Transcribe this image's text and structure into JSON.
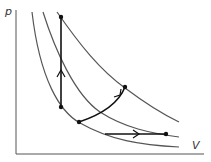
{
  "diagram": {
    "type": "pV-diagram",
    "axes": {
      "y_label": "p",
      "x_label": "V"
    },
    "colors": {
      "axis": "#555555",
      "isotherm": "#555555",
      "process": "#111111",
      "point": "#111111"
    },
    "isotherms": [
      {
        "name": "isotherm-low",
        "path": "M32,12 C40,80 60,112 80,123 C110,140 140,145 179,147"
      },
      {
        "name": "isotherm-mid",
        "path": "M43,12 C55,50 75,95 100,112 C125,128 150,133 179,137"
      },
      {
        "name": "isotherm-high",
        "path": "M57,12 C80,45 100,70 125,88 C145,103 160,113 179,122"
      }
    ],
    "points": [
      {
        "name": "point-top",
        "x": 61,
        "y": 17
      },
      {
        "name": "point-left",
        "x": 61,
        "y": 107
      },
      {
        "name": "point-bottom",
        "x": 79,
        "y": 122
      },
      {
        "name": "point-upper-right",
        "x": 125,
        "y": 87
      },
      {
        "name": "point-lower-right",
        "x": 166,
        "y": 134
      }
    ],
    "processes": [
      {
        "name": "isochoric-process",
        "path": "M61,107 L61,17",
        "arrow": "M57,77 L61,70 L65,77"
      },
      {
        "name": "curved-process",
        "path": "M79,122 C100,115 118,105 125,87",
        "arrow": "M114,97 L120,95 L121,89"
      },
      {
        "name": "isobaric-process",
        "path": "M105,134 L166,134",
        "arrow": "M133,130 L139,134 L133,138"
      }
    ]
  }
}
